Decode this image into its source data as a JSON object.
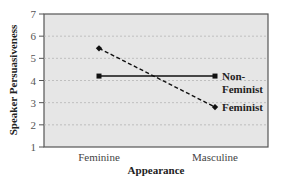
{
  "chart_data": {
    "type": "line",
    "title": "",
    "xlabel": "Appearance",
    "ylabel": "Speaker Persuasiveness",
    "categories": [
      "Feminine",
      "Masculine"
    ],
    "ylim": [
      1,
      7
    ],
    "yticks": [
      1,
      2,
      3,
      4,
      5,
      6,
      7
    ],
    "grid": true,
    "series": [
      {
        "name": "Non-Feminist",
        "label_lines": [
          "Non-",
          "Feminist"
        ],
        "style": "solid",
        "values": [
          4.2,
          4.2
        ]
      },
      {
        "name": "Feminist",
        "label_lines": [
          "Feminist"
        ],
        "style": "dashed",
        "values": [
          5.45,
          2.8
        ]
      }
    ],
    "legend": "inline-right",
    "colors": {
      "plot_bg": "#e6e6e6",
      "line": "#111111",
      "grid": "#b5b5b5"
    }
  }
}
